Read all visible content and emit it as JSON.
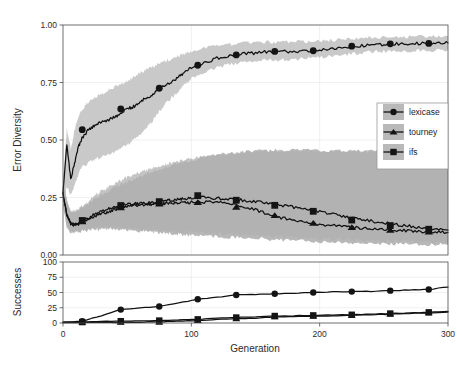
{
  "figure": {
    "background": "#ffffff",
    "width": 463,
    "height": 366
  },
  "chart_data": {
    "type": "line",
    "title": "",
    "subtitle": "",
    "xlabel": "Generation",
    "xlim": [
      0,
      300
    ],
    "xticks": [
      0,
      100,
      200,
      300
    ],
    "xticklabels": [
      "0",
      "100",
      "200",
      "300"
    ],
    "grid": true,
    "legend": {
      "position": "inside-right",
      "entries": [
        {
          "name": "lexicase",
          "marker": "circle",
          "color": "#141414",
          "band_color": "#c8c8c8"
        },
        {
          "name": "tourney",
          "marker": "triangle",
          "color": "#141414",
          "band_color": "#9a9a9a"
        },
        {
          "name": "ifs",
          "marker": "square",
          "color": "#141414",
          "band_color": "#b4b4b4"
        }
      ]
    },
    "panels": [
      {
        "id": "error-diversity",
        "ylabel": "Error Diversity",
        "ylim": [
          0.0,
          1.0
        ],
        "yticks": [
          0.0,
          0.25,
          0.5,
          0.75,
          1.0
        ],
        "yticklabels": [
          "0.00",
          "0.25",
          "0.50",
          "0.75",
          "1.00"
        ],
        "x": [
          0,
          3,
          6,
          9,
          12,
          15,
          20,
          25,
          30,
          35,
          40,
          45,
          50,
          55,
          60,
          65,
          70,
          75,
          80,
          85,
          90,
          95,
          100,
          110,
          120,
          130,
          140,
          150,
          160,
          170,
          180,
          190,
          200,
          210,
          220,
          230,
          240,
          250,
          260,
          270,
          280,
          290,
          300
        ],
        "series": [
          {
            "name": "lexicase",
            "marker": "circle",
            "values": [
              0.27,
              0.48,
              0.33,
              0.4,
              0.47,
              0.51,
              0.545,
              0.565,
              0.58,
              0.585,
              0.6,
              0.615,
              0.635,
              0.645,
              0.665,
              0.685,
              0.695,
              0.725,
              0.74,
              0.755,
              0.775,
              0.795,
              0.815,
              0.835,
              0.855,
              0.865,
              0.875,
              0.878,
              0.885,
              0.885,
              0.885,
              0.888,
              0.89,
              0.895,
              0.902,
              0.908,
              0.912,
              0.915,
              0.918,
              0.918,
              0.92,
              0.92,
              0.922
            ],
            "band_lower": [
              0.22,
              0.3,
              0.26,
              0.3,
              0.35,
              0.385,
              0.4,
              0.415,
              0.425,
              0.435,
              0.45,
              0.465,
              0.48,
              0.5,
              0.525,
              0.555,
              0.585,
              0.625,
              0.66,
              0.685,
              0.715,
              0.745,
              0.765,
              0.795,
              0.815,
              0.828,
              0.838,
              0.842,
              0.848,
              0.848,
              0.85,
              0.855,
              0.858,
              0.865,
              0.872,
              0.878,
              0.882,
              0.885,
              0.888,
              0.888,
              0.89,
              0.89,
              0.892
            ],
            "band_upper": [
              0.32,
              0.55,
              0.46,
              0.54,
              0.6,
              0.635,
              0.665,
              0.685,
              0.7,
              0.715,
              0.728,
              0.742,
              0.758,
              0.772,
              0.79,
              0.805,
              0.818,
              0.832,
              0.845,
              0.855,
              0.865,
              0.875,
              0.885,
              0.898,
              0.908,
              0.915,
              0.92,
              0.922,
              0.925,
              0.925,
              0.926,
              0.928,
              0.93,
              0.933,
              0.938,
              0.942,
              0.945,
              0.947,
              0.948,
              0.948,
              0.95,
              0.95,
              0.952
            ],
            "marker_x": [
              15,
              45,
              75,
              105,
              135,
              165,
              195,
              225,
              255,
              285
            ],
            "marker_y": [
              0.545,
              0.635,
              0.725,
              0.825,
              0.87,
              0.885,
              0.888,
              0.908,
              0.918,
              0.92
            ]
          },
          {
            "name": "tourney",
            "marker": "triangle",
            "values": [
              0.27,
              0.175,
              0.135,
              0.13,
              0.135,
              0.145,
              0.155,
              0.168,
              0.178,
              0.188,
              0.198,
              0.206,
              0.212,
              0.216,
              0.218,
              0.219,
              0.221,
              0.222,
              0.224,
              0.226,
              0.227,
              0.228,
              0.229,
              0.23,
              0.228,
              0.222,
              0.212,
              0.196,
              0.178,
              0.162,
              0.152,
              0.142,
              0.134,
              0.128,
              0.122,
              0.118,
              0.114,
              0.11,
              0.108,
              0.105,
              0.102,
              0.1,
              0.098
            ],
            "band_lower": [
              0.22,
              0.12,
              0.1,
              0.098,
              0.1,
              0.105,
              0.108,
              0.11,
              0.112,
              0.112,
              0.112,
              0.112,
              0.11,
              0.108,
              0.105,
              0.102,
              0.1,
              0.098,
              0.095,
              0.092,
              0.09,
              0.088,
              0.085,
              0.082,
              0.08,
              0.078,
              0.075,
              0.072,
              0.068,
              0.065,
              0.062,
              0.06,
              0.058,
              0.056,
              0.054,
              0.052,
              0.05,
              0.05,
              0.048,
              0.048,
              0.046,
              0.046,
              0.045
            ],
            "band_upper": [
              0.32,
              0.24,
              0.19,
              0.185,
              0.195,
              0.21,
              0.225,
              0.245,
              0.262,
              0.278,
              0.292,
              0.305,
              0.318,
              0.33,
              0.342,
              0.352,
              0.362,
              0.372,
              0.382,
              0.39,
              0.398,
              0.405,
              0.412,
              0.425,
              0.435,
              0.442,
              0.448,
              0.452,
              0.455,
              0.456,
              0.456,
              0.455,
              0.455,
              0.454,
              0.453,
              0.452,
              0.452,
              0.451,
              0.45,
              0.45,
              0.45,
              0.449,
              0.448
            ],
            "marker_x": [
              15,
              45,
              75,
              105,
              135,
              165,
              195,
              225,
              255,
              285
            ],
            "marker_y": [
              0.145,
              0.206,
              0.222,
              0.229,
              0.208,
              0.172,
              0.138,
              0.12,
              0.108,
              0.1
            ]
          },
          {
            "name": "ifs",
            "marker": "square",
            "values": [
              0.27,
              0.175,
              0.135,
              0.132,
              0.14,
              0.15,
              0.162,
              0.178,
              0.19,
              0.2,
              0.208,
              0.215,
              0.22,
              0.222,
              0.224,
              0.226,
              0.229,
              0.232,
              0.235,
              0.238,
              0.241,
              0.244,
              0.248,
              0.252,
              0.246,
              0.242,
              0.238,
              0.232,
              0.224,
              0.216,
              0.208,
              0.2,
              0.19,
              0.178,
              0.165,
              0.155,
              0.148,
              0.14,
              0.132,
              0.125,
              0.118,
              0.112,
              0.108
            ],
            "band_lower": [
              0.22,
              0.12,
              0.1,
              0.1,
              0.105,
              0.11,
              0.115,
              0.118,
              0.12,
              0.12,
              0.12,
              0.118,
              0.116,
              0.114,
              0.112,
              0.11,
              0.108,
              0.106,
              0.104,
              0.102,
              0.1,
              0.098,
              0.096,
              0.094,
              0.092,
              0.09,
              0.088,
              0.085,
              0.082,
              0.08,
              0.078,
              0.075,
              0.072,
              0.07,
              0.068,
              0.066,
              0.064,
              0.062,
              0.06,
              0.058,
              0.056,
              0.055,
              0.054
            ],
            "band_upper": [
              0.32,
              0.24,
              0.19,
              0.19,
              0.2,
              0.215,
              0.235,
              0.258,
              0.278,
              0.295,
              0.31,
              0.325,
              0.338,
              0.35,
              0.36,
              0.37,
              0.378,
              0.386,
              0.394,
              0.4,
              0.406,
              0.412,
              0.418,
              0.428,
              0.436,
              0.442,
              0.446,
              0.45,
              0.452,
              0.453,
              0.454,
              0.454,
              0.454,
              0.453,
              0.452,
              0.451,
              0.45,
              0.45,
              0.449,
              0.448,
              0.448,
              0.447,
              0.446
            ],
            "marker_x": [
              15,
              45,
              75,
              105,
              135,
              165,
              195,
              225,
              255,
              285
            ],
            "marker_y": [
              0.15,
              0.215,
              0.232,
              0.258,
              0.238,
              0.216,
              0.19,
              0.152,
              0.128,
              0.112
            ]
          }
        ]
      },
      {
        "id": "successes",
        "ylabel": "Successes",
        "ylim": [
          0,
          100
        ],
        "yticks": [
          0,
          25,
          50,
          75,
          100
        ],
        "yticklabels": [
          "0",
          "25",
          "50",
          "75",
          "100"
        ],
        "x": [
          0,
          15,
          30,
          45,
          60,
          75,
          90,
          105,
          120,
          135,
          150,
          165,
          180,
          195,
          210,
          225,
          240,
          255,
          270,
          285,
          300
        ],
        "series": [
          {
            "name": "lexicase",
            "marker": "circle",
            "values": [
              1,
              3,
              12,
              22,
              25,
              27,
              33,
              39,
              42,
              46,
              47,
              48,
              49,
              50,
              51,
              51.5,
              52,
              53,
              54,
              55,
              59
            ],
            "marker_x": [
              15,
              45,
              75,
              105,
              135,
              165,
              195,
              225,
              255,
              285
            ],
            "marker_y": [
              3,
              22,
              27,
              39,
              46,
              48,
              50,
              51.5,
              53,
              55
            ]
          },
          {
            "name": "tourney",
            "marker": "triangle",
            "values": [
              1,
              1,
              1,
              1,
              1.5,
              2,
              3,
              4,
              6,
              7,
              8,
              10,
              10.5,
              11,
              12,
              12.5,
              13.5,
              14.5,
              15.5,
              16.5,
              18
            ],
            "marker_x": [
              15,
              45,
              75,
              105,
              135,
              165,
              195,
              225,
              255,
              285
            ],
            "marker_y": [
              1,
              1,
              1,
              4,
              7,
              10,
              11,
              12.5,
              14.5,
              16.5
            ]
          },
          {
            "name": "ifs",
            "marker": "square",
            "values": [
              1,
              1.5,
              2.5,
              3,
              3.5,
              4,
              5,
              6,
              8,
              9,
              10,
              11.5,
              12,
              12.5,
              13,
              13.5,
              14.5,
              15.5,
              16.5,
              17.5,
              19
            ],
            "marker_x": [
              15,
              45,
              75,
              105,
              135,
              165,
              195,
              225,
              255,
              285
            ],
            "marker_y": [
              1.5,
              3,
              4,
              6,
              9,
              11.5,
              12.5,
              13.5,
              15.5,
              17.5
            ]
          }
        ]
      }
    ]
  }
}
